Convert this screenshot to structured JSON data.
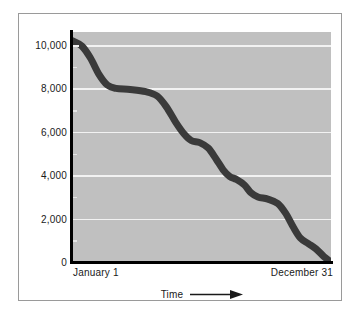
{
  "chart_data": {
    "type": "line",
    "title": "",
    "subtitle": "",
    "xlabel": "Time",
    "ylabel": "",
    "xlim": [
      0,
      365
    ],
    "ylim": [
      0,
      10600
    ],
    "grid": true,
    "legend": null,
    "x_tick_labels": [
      "January 1",
      "December 31"
    ],
    "y_ticks": [
      0,
      2000,
      4000,
      6000,
      8000,
      10000
    ],
    "y_tick_labels": [
      "0",
      "2,000",
      "4,000",
      "6,000",
      "8,000",
      "10,000"
    ],
    "y_minor_ticks": [
      1000,
      3000,
      5000,
      7000,
      9000
    ],
    "annotations": [
      {
        "text": "Time",
        "arrow": "right",
        "position": "below-x-axis"
      }
    ],
    "series": [
      {
        "name": "Remaining",
        "style": "thick-stepped-descending",
        "points": [
          {
            "x": 0,
            "y": 10200
          },
          {
            "x": 14,
            "y": 9950
          },
          {
            "x": 26,
            "y": 9400
          },
          {
            "x": 38,
            "y": 8650
          },
          {
            "x": 50,
            "y": 8150
          },
          {
            "x": 62,
            "y": 8000
          },
          {
            "x": 82,
            "y": 7950
          },
          {
            "x": 104,
            "y": 7850
          },
          {
            "x": 120,
            "y": 7650
          },
          {
            "x": 133,
            "y": 7150
          },
          {
            "x": 146,
            "y": 6450
          },
          {
            "x": 158,
            "y": 5900
          },
          {
            "x": 168,
            "y": 5600
          },
          {
            "x": 180,
            "y": 5500
          },
          {
            "x": 192,
            "y": 5250
          },
          {
            "x": 203,
            "y": 4750
          },
          {
            "x": 213,
            "y": 4250
          },
          {
            "x": 222,
            "y": 3950
          },
          {
            "x": 232,
            "y": 3800
          },
          {
            "x": 243,
            "y": 3550
          },
          {
            "x": 252,
            "y": 3200
          },
          {
            "x": 262,
            "y": 3000
          },
          {
            "x": 276,
            "y": 2900
          },
          {
            "x": 290,
            "y": 2700
          },
          {
            "x": 301,
            "y": 2250
          },
          {
            "x": 312,
            "y": 1600
          },
          {
            "x": 322,
            "y": 1100
          },
          {
            "x": 333,
            "y": 850
          },
          {
            "x": 344,
            "y": 600
          },
          {
            "x": 355,
            "y": 250
          },
          {
            "x": 365,
            "y": 0
          }
        ]
      }
    ],
    "colors": {
      "plot_background": "#c0c0c0",
      "gridline": "#f2f2f2",
      "curve": "#3a3a3a",
      "axis": "#000000",
      "text": "#1a1a1a",
      "figure_background": "#ffffff",
      "figure_border": "#9a9a9a"
    }
  }
}
